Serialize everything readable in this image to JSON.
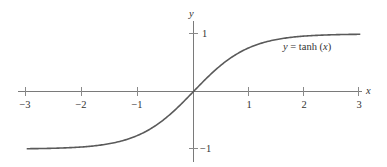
{
  "chart_data": {
    "type": "line",
    "title": "",
    "xlabel": "x",
    "ylabel": "y",
    "xlim": [
      -3,
      3
    ],
    "ylim": [
      -1,
      1
    ],
    "grid": false,
    "x_ticks": [
      -3,
      -2,
      -1,
      1,
      2,
      3
    ],
    "x_tick_labels": [
      "−3",
      "−2",
      "−1",
      "1",
      "2",
      "3"
    ],
    "y_ticks": [
      1,
      -1
    ],
    "y_tick_labels": [
      "1",
      "−1"
    ],
    "series": [
      {
        "name": "y = tanh (x)",
        "function": "tanh",
        "x": [
          -3,
          -2.5,
          -2,
          -1.5,
          -1,
          -0.5,
          0,
          0.5,
          1,
          1.5,
          2,
          2.5,
          3
        ],
        "values": [
          -0.995,
          -0.987,
          -0.964,
          -0.905,
          -0.762,
          -0.462,
          0,
          0.462,
          0.762,
          0.905,
          0.964,
          0.987,
          0.995
        ]
      }
    ],
    "annotations": [
      {
        "text_parts": [
          "y",
          " = tanh (",
          "x",
          ")"
        ],
        "x": 1.65,
        "y": 0.72
      }
    ]
  },
  "labels": {
    "x_axis": "x",
    "y_axis": "y",
    "curve_label_y": "y",
    "curve_label_mid": " = tanh (",
    "curve_label_x": "x",
    "curve_label_end": ")",
    "xt_m3": "−3",
    "xt_m2": "−2",
    "xt_m1": "−1",
    "xt_1": "1",
    "xt_2": "2",
    "xt_3": "3",
    "yt_1": "1",
    "yt_m1": "−1"
  }
}
